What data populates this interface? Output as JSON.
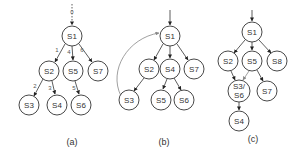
{
  "panels": [
    {
      "caption": "(a)",
      "entry_label": "0",
      "nodes": [
        {
          "id": "S1",
          "label": "S1"
        },
        {
          "id": "S2",
          "label": "S2"
        },
        {
          "id": "S5",
          "label": "S5"
        },
        {
          "id": "S7",
          "label": "S7"
        },
        {
          "id": "S3",
          "label": "S3"
        },
        {
          "id": "S4",
          "label": "S4"
        },
        {
          "id": "S6",
          "label": "S6"
        }
      ],
      "edges": [
        {
          "from": "entry",
          "to": "S1",
          "label": "0"
        },
        {
          "from": "S1",
          "to": "S2",
          "label": "1"
        },
        {
          "from": "S1",
          "to": "S5",
          "label": "4"
        },
        {
          "from": "S1",
          "to": "S7",
          "label": "6"
        },
        {
          "from": "S2",
          "to": "S3",
          "label": "2"
        },
        {
          "from": "S2",
          "to": "S4",
          "label": "3"
        },
        {
          "from": "S5",
          "to": "S6",
          "label": "5"
        }
      ]
    },
    {
      "caption": "(b)",
      "nodes": [
        {
          "id": "S1",
          "label": "S1"
        },
        {
          "id": "S2",
          "label": "S2"
        },
        {
          "id": "S4",
          "label": "S4"
        },
        {
          "id": "S7",
          "label": "S7"
        },
        {
          "id": "S3",
          "label": "S3"
        },
        {
          "id": "S5",
          "label": "S5"
        },
        {
          "id": "S6",
          "label": "S6"
        }
      ],
      "edges": [
        {
          "from": "entry",
          "to": "S1"
        },
        {
          "from": "S1",
          "to": "S2"
        },
        {
          "from": "S1",
          "to": "S4"
        },
        {
          "from": "S1",
          "to": "S7"
        },
        {
          "from": "S2",
          "to": "S3"
        },
        {
          "from": "S4",
          "to": "S5"
        },
        {
          "from": "S4",
          "to": "S6"
        },
        {
          "from": "S3",
          "to": "S1",
          "style": "curved-back-edge"
        }
      ]
    },
    {
      "caption": "(c)",
      "nodes": [
        {
          "id": "S1",
          "label": "S1"
        },
        {
          "id": "S2",
          "label": "S2"
        },
        {
          "id": "S5",
          "label": "S5"
        },
        {
          "id": "S8",
          "label": "S8"
        },
        {
          "id": "S3S6",
          "label_line1": "S3/",
          "label_line2": "S6"
        },
        {
          "id": "S7",
          "label": "S7"
        },
        {
          "id": "S4",
          "label": "S4"
        }
      ],
      "edges": [
        {
          "from": "entry",
          "to": "S1"
        },
        {
          "from": "S1",
          "to": "S2"
        },
        {
          "from": "S1",
          "to": "S5"
        },
        {
          "from": "S1",
          "to": "S8"
        },
        {
          "from": "S2",
          "to": "S3S6"
        },
        {
          "from": "S5",
          "to": "S3S6",
          "style": "gray"
        },
        {
          "from": "S5",
          "to": "S7"
        },
        {
          "from": "S3S6",
          "to": "S4"
        }
      ]
    }
  ]
}
